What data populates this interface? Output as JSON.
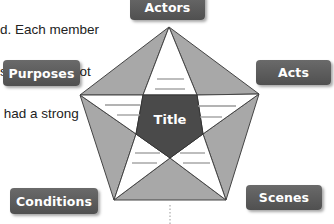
{
  "paragraph": {
    "lines": [
      "d. Each member",
      "s of a work. Jot",
      " had a strong"
    ]
  },
  "diagram": {
    "center_label": "Title",
    "labels": {
      "top": "Actors",
      "right": "Acts",
      "left": "Purposes",
      "bottom_left": "Conditions",
      "bottom_right": "Scenes"
    },
    "colors": {
      "shaded_triangles": "#a8a8a8",
      "star_points": "#ffffff",
      "center": "#4a4a4a",
      "label_bg": "#5a5a5a",
      "label_text": "#ffffff",
      "outline": "#444444",
      "writing_lines": "#9a9a9a"
    }
  }
}
